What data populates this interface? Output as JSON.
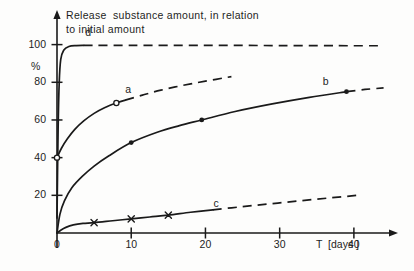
{
  "chart_data": {
    "type": "line",
    "title": "Release  substance amount, in relation\nto initial amount",
    "title_line1": "Release  substance amount, in relation",
    "title_line2": "to initial amount",
    "xlabel": "T  [days ]",
    "ylabel": "%",
    "xlim": [
      0,
      45
    ],
    "ylim": [
      0,
      112
    ],
    "grid": false,
    "legend_position": "inline-curve-labels",
    "xticks": [
      "0",
      "10",
      "20",
      "30",
      "40"
    ],
    "xtick_values": [
      0,
      10,
      20,
      30,
      40
    ],
    "yticks": [
      "20",
      "40",
      "60",
      "80",
      "100"
    ],
    "ytick_values": [
      20,
      40,
      60,
      80,
      100
    ],
    "series": [
      {
        "name": "d",
        "label": "d",
        "marker": "none",
        "solid_points": [
          [
            0.0,
            8
          ],
          [
            0.15,
            55
          ],
          [
            0.3,
            80
          ],
          [
            0.5,
            92
          ],
          [
            0.9,
            97
          ],
          [
            1.6,
            99
          ],
          [
            2.6,
            99.5
          ],
          [
            3.6,
            99.6
          ]
        ],
        "dashed_points": [
          [
            3.6,
            99.6
          ],
          [
            10,
            99.6
          ],
          [
            20,
            99.6
          ],
          [
            30,
            99.5
          ],
          [
            40,
            99.4
          ],
          [
            44,
            99.4
          ]
        ],
        "label_x": 4.2,
        "label_y": 106
      },
      {
        "name": "a",
        "label": "a",
        "marker": "open-circle",
        "data_points": [
          [
            0,
            40
          ],
          [
            8,
            69
          ]
        ],
        "solid_points": [
          [
            0.0,
            40
          ],
          [
            0.6,
            45
          ],
          [
            1.4,
            50
          ],
          [
            2.4,
            55
          ],
          [
            3.6,
            59.5
          ],
          [
            5.0,
            63.5
          ],
          [
            6.4,
            66.5
          ],
          [
            8.0,
            69.0
          ],
          [
            9.2,
            70.5
          ]
        ],
        "dashed_points": [
          [
            9.2,
            70.5
          ],
          [
            11.5,
            73.2
          ],
          [
            14,
            75.8
          ],
          [
            17,
            78.4
          ],
          [
            20,
            80.6
          ],
          [
            23.5,
            83.0
          ]
        ],
        "label_x": 9.6,
        "label_y": 76
      },
      {
        "name": "b",
        "label": "b",
        "marker": "filled-circle",
        "data_points": [
          [
            10,
            48
          ],
          [
            19.5,
            60
          ],
          [
            39,
            75
          ]
        ],
        "solid_points": [
          [
            0.0,
            0
          ],
          [
            0.4,
            10
          ],
          [
            1.0,
            17
          ],
          [
            2.0,
            24
          ],
          [
            3.4,
            30
          ],
          [
            5.0,
            35.5
          ],
          [
            7.0,
            41
          ],
          [
            10.0,
            48.0
          ],
          [
            13.5,
            53.5
          ],
          [
            16.5,
            57
          ],
          [
            19.5,
            60.0
          ],
          [
            24,
            64.5
          ],
          [
            29,
            68.5
          ],
          [
            34,
            72
          ],
          [
            39.0,
            75.0
          ]
        ],
        "dashed_points": [
          [
            39.0,
            75.0
          ],
          [
            41.5,
            76.2
          ],
          [
            44,
            77.0
          ]
        ],
        "label_x": 36.2,
        "label_y": 80
      },
      {
        "name": "c",
        "label": "c",
        "marker": "cross",
        "data_points": [
          [
            5,
            5.5
          ],
          [
            10,
            7.5
          ],
          [
            15,
            9.5
          ]
        ],
        "solid_points": [
          [
            0.0,
            0
          ],
          [
            0.5,
            1.5
          ],
          [
            1.2,
            3.0
          ],
          [
            2.2,
            4.3
          ],
          [
            3.5,
            5.1
          ],
          [
            5.0,
            5.5
          ],
          [
            7.5,
            6.5
          ],
          [
            10.0,
            7.5
          ],
          [
            12.5,
            8.5
          ],
          [
            15.0,
            9.5
          ],
          [
            18,
            11.0
          ],
          [
            21,
            12.3
          ]
        ],
        "dashed_points": [
          [
            21,
            12.3
          ],
          [
            25,
            14.0
          ],
          [
            29,
            15.6
          ],
          [
            33,
            17.2
          ],
          [
            37,
            18.7
          ],
          [
            41,
            20.2
          ]
        ],
        "label_x": 21.5,
        "label_y": 15.5
      }
    ]
  },
  "axis": {
    "y_unit_label": "%",
    "x_axis_caption": "T  [days ]"
  },
  "colors": {
    "ink": "#1a1a1a",
    "background": "#fdfdfc"
  }
}
